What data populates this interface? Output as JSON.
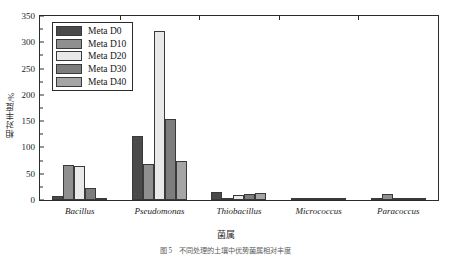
{
  "chart_data": {
    "type": "bar",
    "title": "",
    "xlabel": "菌属",
    "ylabel": "相对丰度/%",
    "categories": [
      "Bacillus",
      "Pseudomonas",
      "Thiobacillus",
      "Micrococcus",
      "Paracoccus"
    ],
    "series": [
      {
        "name": "Meta D0",
        "color": "#4a4a4a",
        "values": [
          7,
          122,
          16,
          0.6,
          3
        ]
      },
      {
        "name": "Meta D10",
        "color": "#8f8f8f",
        "values": [
          66,
          69,
          4,
          0.5,
          11
        ]
      },
      {
        "name": "Meta D20",
        "color": "#e9e9e9",
        "values": [
          64,
          321,
          9,
          0.4,
          4
        ]
      },
      {
        "name": "Meta D30",
        "color": "#7d7d7d",
        "values": [
          23,
          155,
          12,
          0.5,
          1
        ]
      },
      {
        "name": "Meta D40",
        "color": "#a5a5a5",
        "values": [
          4,
          74,
          13,
          0.3,
          0.5
        ]
      }
    ],
    "ylim": [
      0,
      350
    ],
    "yticks": [
      0,
      50,
      100,
      150,
      200,
      250,
      300,
      350
    ],
    "ytick_labels": [
      "0",
      "50",
      "100",
      "150",
      "200",
      "250",
      "300",
      "350"
    ],
    "yminor_step": 25,
    "grid": false,
    "legend_position": "upper-left",
    "legend_entries": [
      "Meta D0",
      "Meta D10",
      "Meta D20",
      "Meta D30",
      "Meta D40"
    ]
  },
  "caption": "图 5　不同处理的土壤中优势菌属相对丰度"
}
